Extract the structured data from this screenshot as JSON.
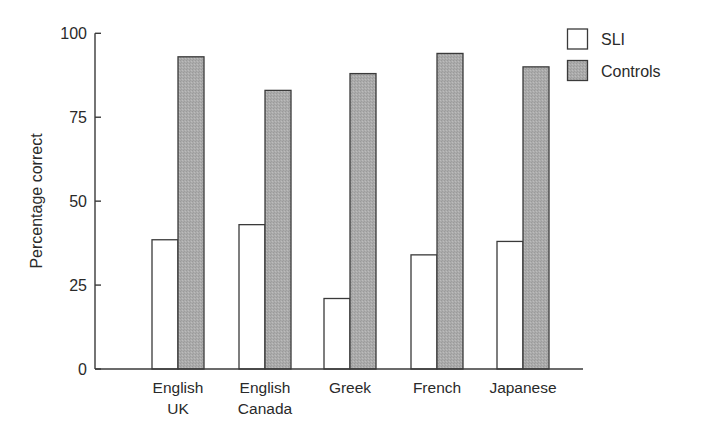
{
  "chart_data": {
    "type": "bar",
    "title": "",
    "xlabel": "",
    "ylabel": "Percentage correct",
    "ylim": [
      0,
      100
    ],
    "yticks": [
      0,
      25,
      50,
      75,
      100
    ],
    "grid": false,
    "legend_position": "top-right",
    "categories": [
      "English UK",
      "English Canada",
      "Greek",
      "French",
      "Japanese"
    ],
    "category_lines": [
      [
        "English",
        "UK"
      ],
      [
        "English",
        "Canada"
      ],
      [
        "Greek"
      ],
      [
        "French"
      ],
      [
        "Japanese"
      ]
    ],
    "series": [
      {
        "name": "SLI",
        "fill": "#ffffff",
        "values": [
          38.5,
          43,
          21,
          34,
          38
        ]
      },
      {
        "name": "Controls",
        "fill": "#a9a9a9",
        "values": [
          93,
          83,
          88,
          94,
          90
        ]
      }
    ]
  },
  "colors": {
    "axis": "#3a3a3a",
    "bar_stroke": "#3a3a3a",
    "controls_fill": "#a9a9a9",
    "sli_fill": "#ffffff"
  }
}
